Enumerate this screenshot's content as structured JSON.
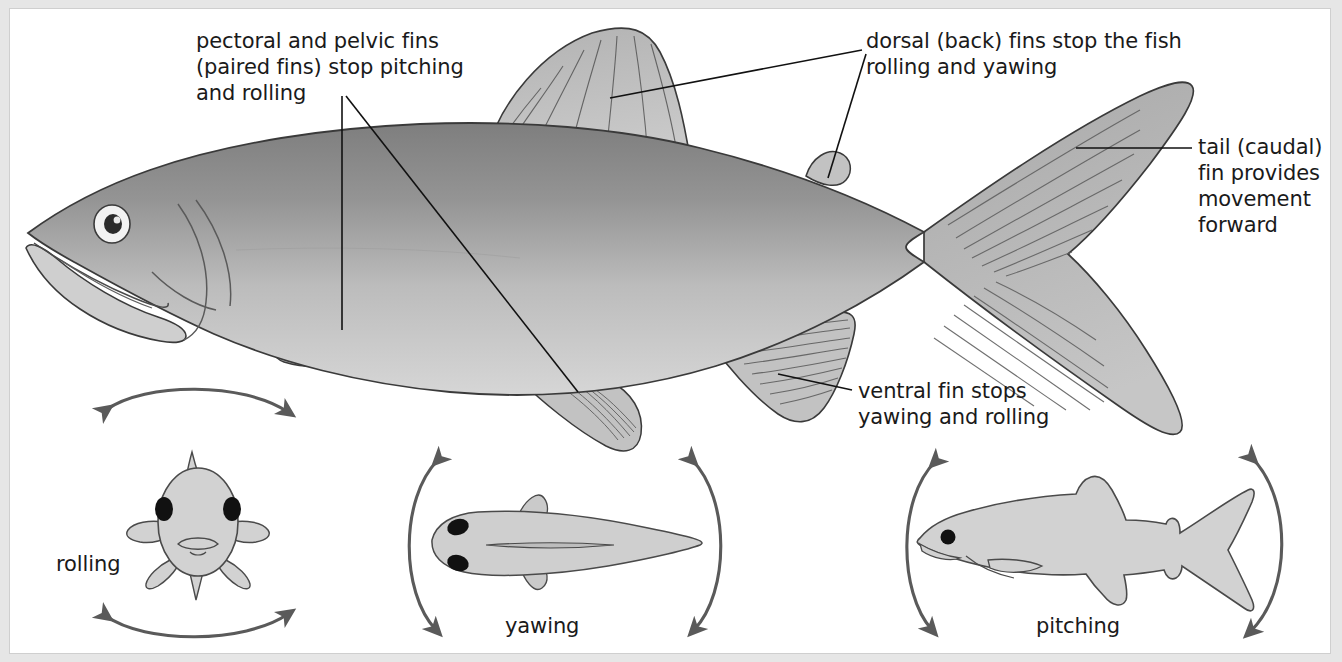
{
  "figure": {
    "background": "#e6e6e6",
    "panel_background": "#ffffff",
    "ink": "#1a1a1a"
  },
  "annotations": {
    "pectoral_pelvic": {
      "line1": "pectoral and pelvic fins",
      "line2": "(paired fins) stop pitching",
      "line3": "and rolling"
    },
    "dorsal": {
      "line1": "dorsal (back) fins stop the fish",
      "line2": "rolling and yawing"
    },
    "tail": {
      "line1": "tail (caudal)",
      "line2": "fin provides",
      "line3": "movement",
      "line4": "forward"
    },
    "ventral": {
      "line1": "ventral fin stops",
      "line2": "yawing and rolling"
    }
  },
  "motion_diagrams": [
    {
      "id": "rolling",
      "label": "rolling",
      "view": "front view of fish, arrows arc above and below"
    },
    {
      "id": "yawing",
      "label": "yawing",
      "view": "top view of fish, arrows arc left and right"
    },
    {
      "id": "pitching",
      "label": "pitching",
      "view": "side view of fish, arrows arc at nose and tail"
    }
  ],
  "colors": {
    "body_dark": "#8d8d8d",
    "body_light": "#cfcfcf",
    "fin_fill": "#bdbdbd",
    "small_fish_fill": "#d2d2d2",
    "outline": "#3a3a3a",
    "arrow": "#5a5a5a",
    "eye_white": "#f2f2f2",
    "eye_pupil": "#2b2b2b"
  }
}
